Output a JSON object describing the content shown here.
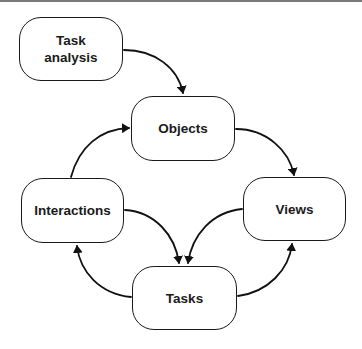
{
  "diagram": {
    "type": "flow-cycle",
    "nodes": [
      {
        "id": "task_analysis",
        "label": "Task\nanalysis",
        "x": 19,
        "y": 17,
        "w": 104,
        "h": 64
      },
      {
        "id": "objects",
        "label": "Objects",
        "x": 131,
        "y": 96,
        "w": 104,
        "h": 65
      },
      {
        "id": "views",
        "label": "Views",
        "x": 243,
        "y": 177,
        "w": 103,
        "h": 64
      },
      {
        "id": "interactions",
        "label": "Interactions",
        "x": 21,
        "y": 178,
        "w": 103,
        "h": 65
      },
      {
        "id": "tasks",
        "label": "Tasks",
        "x": 132,
        "y": 266,
        "w": 105,
        "h": 64
      }
    ],
    "edges": [
      {
        "from": "task_analysis",
        "to": "objects"
      },
      {
        "from": "objects",
        "to": "views"
      },
      {
        "from": "views",
        "to": "tasks"
      },
      {
        "from": "interactions",
        "to": "tasks"
      },
      {
        "from": "tasks",
        "to": "interactions"
      },
      {
        "from": "tasks",
        "to": "views"
      },
      {
        "from": "interactions",
        "to": "objects"
      }
    ]
  }
}
